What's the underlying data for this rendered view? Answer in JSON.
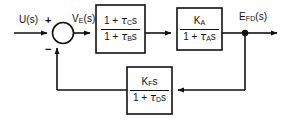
{
  "diagram": {
    "type": "control-block-diagram",
    "background_color": "#ffffff",
    "line_color": "#111111",
    "box_fill": "#ffffff",
    "signals": {
      "input": "U(s)",
      "input_base": "U",
      "input_sub": "",
      "input_suffix": "(s)",
      "error": "V_E(s)",
      "error_base": "V",
      "error_sub": "E",
      "error_suffix": "(s)",
      "output": "E_FD(s)",
      "output_base": "E",
      "output_sub": "FD",
      "output_suffix": "(s)"
    },
    "summing_junction": {
      "name": "summing-junction",
      "plus_sign": "+",
      "minus_sign": "−",
      "plus_input": "U(s)",
      "minus_input": "feedback"
    },
    "blocks": [
      {
        "id": "lead-lag-block",
        "numerator_pre": "1 + ",
        "numerator_tau": "τ",
        "numerator_sub": "C",
        "numerator_post": "s",
        "denominator_pre": "1 + ",
        "denominator_tau": "τ",
        "denominator_sub": "B",
        "denominator_post": "s",
        "expression": "(1 + τC s) / (1 + τB s)"
      },
      {
        "id": "amplifier-block",
        "numerator_pre": "K",
        "numerator_sub": "A",
        "numerator_post": "",
        "denominator_pre": "1 + ",
        "denominator_tau": "τ",
        "denominator_sub": "A",
        "denominator_post": "s",
        "expression": "KA / (1 + τA s)"
      },
      {
        "id": "feedback-block",
        "numerator_pre": "K",
        "numerator_sub": "F",
        "numerator_post": "s",
        "denominator_pre": "1 + ",
        "denominator_tau": "τ",
        "denominator_sub": "D",
        "denominator_post": "s",
        "expression": "KF s / (1 + τD s)"
      }
    ]
  }
}
